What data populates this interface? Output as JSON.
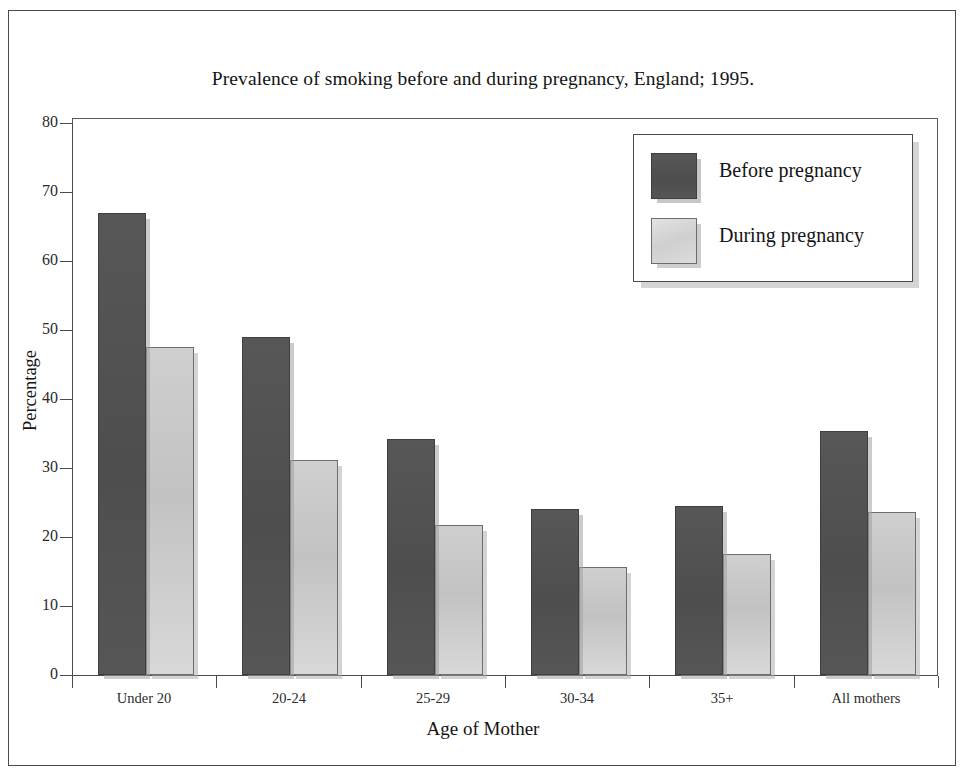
{
  "chart_data": {
    "type": "bar",
    "title": "Prevalence of smoking before and during pregnancy, England; 1995.",
    "xlabel": "Age of Mother",
    "ylabel": "Percentage",
    "categories": [
      "Under 20",
      "20-24",
      "25-29",
      "30-34",
      "35+",
      "All mothers"
    ],
    "series": [
      {
        "name": "Before pregnancy",
        "color": "#525252",
        "values": [
          67.0,
          49.0,
          34.2,
          24.0,
          24.5,
          35.4
        ]
      },
      {
        "name": "During pregnancy",
        "color": "#c8c8c8",
        "values": [
          47.5,
          31.2,
          21.8,
          15.7,
          17.6,
          23.6
        ]
      }
    ],
    "ylim": [
      0,
      80
    ],
    "yticks": [
      0,
      10,
      20,
      30,
      40,
      50,
      60,
      70,
      80
    ],
    "ytick_labels": [
      "0",
      "10",
      "20",
      "30",
      "40",
      "50",
      "60",
      "70",
      "80"
    ],
    "grid": false,
    "legend_position": "top-right",
    "legend_entries": [
      "Before pregnancy",
      "During pregnancy"
    ]
  },
  "frame": {
    "border_color": "#4a4a4a",
    "background": "#ffffff"
  }
}
